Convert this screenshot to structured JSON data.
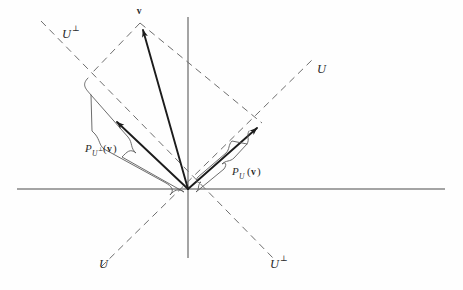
{
  "figure": {
    "kind": "vector-projection-diagram",
    "background_color": "#fefefe",
    "axis_color": "#4a4a4a",
    "dashed_color": "#6e6e6e",
    "vector_color": "#1c1c1c",
    "brace_color": "#5c5c5c"
  },
  "labels": {
    "vector_v": "v",
    "subspace_u_top_left": "U",
    "subspace_u_top_left_sup": "⊥",
    "subspace_u_right": "U",
    "subspace_u_bottom_left": "U",
    "subspace_u_bottom_right": "U",
    "subspace_u_bottom_right_sup": "⊥",
    "proj_perp_p": "P",
    "proj_perp_sub_u": "U",
    "proj_perp_sub_sup": "⊥",
    "proj_perp_open": "(",
    "proj_perp_arg": "v",
    "proj_perp_close": ")",
    "proj_u_p": "P",
    "proj_u_sub_u": "U",
    "proj_u_open": "(",
    "proj_u_arg": "v",
    "proj_u_close": ")"
  },
  "geometry": {
    "origin": {
      "x": 188,
      "y": 189
    },
    "horizontal_axis": {
      "x1": 17,
      "y1": 189,
      "x2": 445,
      "y2": 189
    },
    "vertical_axis": {
      "x1": 188,
      "y1": 17,
      "x2": 188,
      "y2": 258
    },
    "line_u": {
      "x1": 101,
      "y1": 267,
      "x2": 312,
      "y2": 60
    },
    "line_u_perp": {
      "x1": 41,
      "y1": 21,
      "x2": 274,
      "y2": 259
    },
    "vector_v": {
      "x1": 188,
      "y1": 189,
      "x2": 140,
      "y2": 23
    },
    "proj_u": {
      "x1": 188,
      "y1": 189,
      "x2": 262,
      "y2": 123
    },
    "proj_u_perp": {
      "x1": 188,
      "y1": 189,
      "x2": 112,
      "y2": 117
    },
    "guide_v_to_proj_u": {
      "x1": 140,
      "y1": 23,
      "x2": 262,
      "y2": 123
    },
    "guide_v_to_proj_u_perp": {
      "x1": 140,
      "y1": 23,
      "x2": 92,
      "y2": 73
    }
  }
}
